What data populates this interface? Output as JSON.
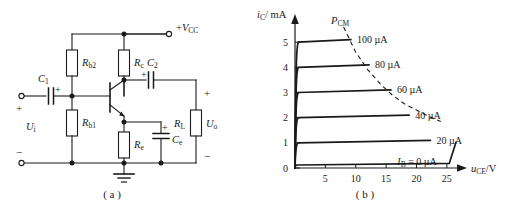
{
  "figure": {
    "panels": [
      {
        "caption": "( a )",
        "kind": "circuit-schematic"
      },
      {
        "caption": "( b )",
        "kind": "output-characteristic-curves"
      }
    ]
  },
  "circuit": {
    "title": "common-emitter amplifier",
    "supply_label": "+V",
    "supply_sub": "CC",
    "components": [
      {
        "name": "C1",
        "base": "C",
        "sub": "1",
        "type": "capacitor",
        "polarity": "+"
      },
      {
        "name": "C2",
        "base": "C",
        "sub": "2",
        "type": "capacitor",
        "polarity": "+"
      },
      {
        "name": "Ce",
        "base": "C",
        "sub": "e",
        "type": "capacitor",
        "polarity": "+"
      },
      {
        "name": "Rb2",
        "base": "R",
        "sub": "b2",
        "type": "resistor"
      },
      {
        "name": "Rb1",
        "base": "R",
        "sub": "b1",
        "type": "resistor"
      },
      {
        "name": "Rc",
        "base": "R",
        "sub": "c",
        "type": "resistor"
      },
      {
        "name": "Re",
        "base": "R",
        "sub": "e",
        "type": "resistor"
      },
      {
        "name": "RL",
        "base": "R",
        "sub": "L",
        "type": "resistor"
      }
    ],
    "ports": [
      {
        "name": "Ui",
        "base": "U",
        "sub": "i",
        "plus": "+",
        "minus": "−"
      },
      {
        "name": "Uo",
        "base": "U",
        "sub": "o",
        "plus": "+",
        "minus": "−"
      }
    ],
    "transistor": {
      "type": "npn-bjt"
    },
    "ground": "earth-ground"
  },
  "chart_data": {
    "type": "line",
    "title": "",
    "xlabel_base": "u",
    "xlabel_sub": "CE",
    "xlabel_unit": "/V",
    "ylabel_base": "i",
    "ylabel_sub": "C",
    "ylabel_unit": "/ mA",
    "xlim": [
      0,
      27
    ],
    "ylim": [
      0,
      5.8
    ],
    "xticks": [
      5,
      10,
      15,
      20,
      25
    ],
    "yticks": [
      0,
      1,
      2,
      3,
      4,
      5
    ],
    "grid": false,
    "legend_position": "inline-right-of-curve",
    "annotations": [
      {
        "text_base": "P",
        "text_sub": "CM",
        "kind": "power-dissipation-limit-hyperbola"
      }
    ],
    "series": [
      {
        "name": "100 µA",
        "ib_uA": 100,
        "ic_sat_mA": 5,
        "x_end": 9.2,
        "label": "100 µA"
      },
      {
        "name": "80 µA",
        "ib_uA": 80,
        "ic_sat_mA": 4,
        "x_end": 12.2,
        "label": "80 µA"
      },
      {
        "name": "60 µA",
        "ib_uA": 60,
        "ic_sat_mA": 3,
        "x_end": 15.8,
        "label": "60 µA"
      },
      {
        "name": "40 µA",
        "ib_uA": 40,
        "ic_sat_mA": 2,
        "x_end": 18.8,
        "label": "40 µA"
      },
      {
        "name": "20 µA",
        "ib_uA": 20,
        "ic_sat_mA": 1,
        "x_end": 22.3,
        "label": "20 µA"
      },
      {
        "name": "IB = 0 µA",
        "ib_uA": 0,
        "ic_sat_mA": 0.12,
        "x_end": 25.4,
        "label_base": "I",
        "label_sub": "B",
        "label_rest": " = 0 µA"
      }
    ],
    "pcm_curve_points": [
      [
        8.0,
        5.6
      ],
      [
        10,
        4.6
      ],
      [
        12,
        3.9
      ],
      [
        14,
        3.35
      ],
      [
        16,
        2.9
      ],
      [
        18,
        2.55
      ],
      [
        20,
        2.3
      ],
      [
        22,
        2.05
      ],
      [
        24,
        1.85
      ]
    ]
  }
}
